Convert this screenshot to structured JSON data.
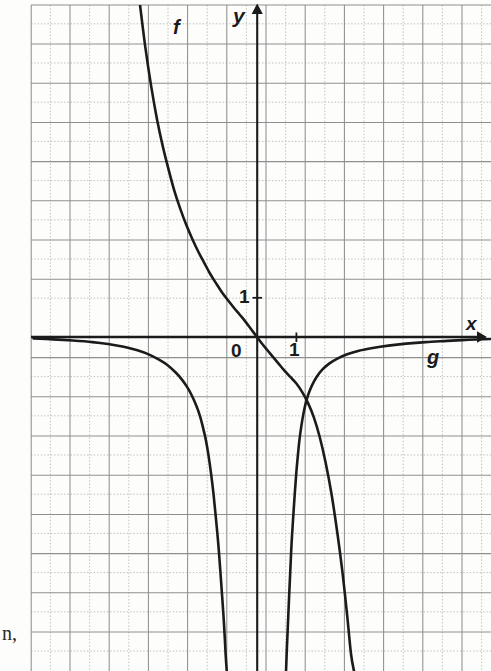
{
  "figure": {
    "kind": "cartesian-graph",
    "background_color": "#fdfdfc",
    "ink_color": "#1b1b1b",
    "grid_major_color": "#8c8c8c",
    "grid_minor_color": "#b9b9b9"
  },
  "labels": {
    "y_axis": "y",
    "x_axis": "x",
    "curve_f": "f",
    "curve_g": "g",
    "y_tick_one": "1",
    "x_tick_one": "1",
    "origin": "0",
    "page_text_fragment": "n,"
  },
  "icons": {
    "y_arrow": "arrow-up-icon",
    "x_arrow": "arrow-right-icon"
  },
  "chart_data": {
    "type": "line",
    "title": "",
    "xlabel": "x",
    "ylabel": "y",
    "grid": true,
    "legend_position": "inline-curve-labels",
    "axis": {
      "origin_px": [
        257,
        337
      ],
      "unit_px": 39.2,
      "xlim": [
        -5.77,
        5.97
      ],
      "ylim": [
        -8.52,
        8.47
      ],
      "x_ticks": [
        0,
        1
      ],
      "y_ticks": [
        1
      ]
    },
    "series": [
      {
        "name": "f",
        "label": "f",
        "description": "steeply decreasing curve: high positive at far left, passes y=1 near x=-1, flattens toward the x-axis just left of the origin, then turns downward and plunges steeply for x greater than about 1.3",
        "points": [
          [
            -3.0,
            8.6
          ],
          [
            -2.85,
            7.4
          ],
          [
            -2.7,
            6.4
          ],
          [
            -2.55,
            5.55
          ],
          [
            -2.4,
            4.85
          ],
          [
            -2.25,
            4.25
          ],
          [
            -2.1,
            3.7
          ],
          [
            -1.95,
            3.25
          ],
          [
            -1.8,
            2.85
          ],
          [
            -1.65,
            2.5
          ],
          [
            -1.5,
            2.18
          ],
          [
            -1.35,
            1.9
          ],
          [
            -1.2,
            1.62
          ],
          [
            -1.05,
            1.38
          ],
          [
            -0.9,
            1.15
          ],
          [
            -0.75,
            0.95
          ],
          [
            -0.6,
            0.76
          ],
          [
            -0.45,
            0.58
          ],
          [
            -0.3,
            0.4
          ],
          [
            -0.15,
            0.2
          ],
          [
            0.0,
            0.0
          ],
          [
            0.12,
            -0.16
          ],
          [
            0.25,
            -0.32
          ],
          [
            0.4,
            -0.5
          ],
          [
            0.55,
            -0.68
          ],
          [
            0.7,
            -0.86
          ],
          [
            0.85,
            -1.02
          ],
          [
            1.0,
            -1.18
          ],
          [
            1.15,
            -1.4
          ],
          [
            1.3,
            -1.68
          ],
          [
            1.45,
            -2.05
          ],
          [
            1.6,
            -2.55
          ],
          [
            1.75,
            -3.2
          ],
          [
            1.9,
            -4.0
          ],
          [
            2.05,
            -5.0
          ],
          [
            2.18,
            -6.0
          ],
          [
            2.3,
            -7.1
          ],
          [
            2.4,
            -8.1
          ],
          [
            2.48,
            -8.55
          ]
        ]
      },
      {
        "name": "g-left",
        "label": "g",
        "description": "left branch of g: hugs the x-axis from below at far left, bends down near x=-1.5 and plunges vertically along x about -0.7",
        "points": [
          [
            -5.7,
            -0.04
          ],
          [
            -5.2,
            -0.06
          ],
          [
            -4.7,
            -0.09
          ],
          [
            -4.2,
            -0.13
          ],
          [
            -3.8,
            -0.18
          ],
          [
            -3.4,
            -0.25
          ],
          [
            -3.05,
            -0.34
          ],
          [
            -2.75,
            -0.45
          ],
          [
            -2.5,
            -0.58
          ],
          [
            -2.28,
            -0.72
          ],
          [
            -2.08,
            -0.9
          ],
          [
            -1.92,
            -1.08
          ],
          [
            -1.78,
            -1.28
          ],
          [
            -1.66,
            -1.5
          ],
          [
            -1.55,
            -1.75
          ],
          [
            -1.46,
            -2.0
          ],
          [
            -1.38,
            -2.3
          ],
          [
            -1.3,
            -2.65
          ],
          [
            -1.24,
            -3.0
          ],
          [
            -1.17,
            -3.5
          ],
          [
            -1.11,
            -4.0
          ],
          [
            -1.05,
            -4.6
          ],
          [
            -0.99,
            -5.25
          ],
          [
            -0.94,
            -5.9
          ],
          [
            -0.89,
            -6.6
          ],
          [
            -0.84,
            -7.35
          ],
          [
            -0.8,
            -8.1
          ],
          [
            -0.77,
            -8.55
          ]
        ]
      },
      {
        "name": "g-right",
        "label": "g",
        "description": "right branch of g: rises steeply out of the bottom near x=0.75, crosses f around x=1.05 at y=-1.1, then flattens and approaches the x-axis from below toward the right edge",
        "points": [
          [
            0.74,
            -8.55
          ],
          [
            0.76,
            -8.0
          ],
          [
            0.79,
            -7.3
          ],
          [
            0.82,
            -6.6
          ],
          [
            0.85,
            -5.95
          ],
          [
            0.88,
            -5.3
          ],
          [
            0.92,
            -4.65
          ],
          [
            0.96,
            -4.05
          ],
          [
            1.0,
            -3.5
          ],
          [
            1.04,
            -3.05
          ],
          [
            1.08,
            -2.65
          ],
          [
            1.13,
            -2.28
          ],
          [
            1.18,
            -1.98
          ],
          [
            1.24,
            -1.7
          ],
          [
            1.31,
            -1.46
          ],
          [
            1.4,
            -1.24
          ],
          [
            1.52,
            -1.02
          ],
          [
            1.66,
            -0.84
          ],
          [
            1.84,
            -0.68
          ],
          [
            2.05,
            -0.55
          ],
          [
            2.3,
            -0.44
          ],
          [
            2.6,
            -0.35
          ],
          [
            2.95,
            -0.28
          ],
          [
            3.35,
            -0.22
          ],
          [
            3.8,
            -0.17
          ],
          [
            4.3,
            -0.13
          ],
          [
            4.85,
            -0.1
          ],
          [
            5.4,
            -0.07
          ],
          [
            5.95,
            -0.05
          ]
        ]
      }
    ]
  }
}
